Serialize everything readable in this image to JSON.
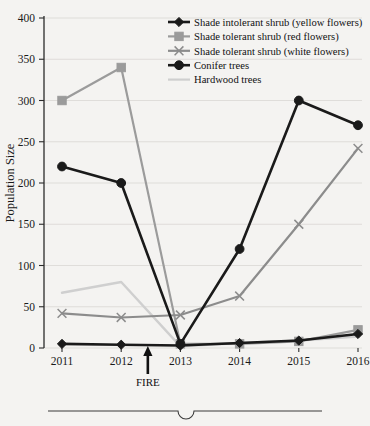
{
  "chart_data": {
    "type": "line",
    "title": "",
    "xlabel": "",
    "ylabel": "Population Size",
    "categories": [
      "2011",
      "2012",
      "2013",
      "2014",
      "2015",
      "2016"
    ],
    "x": [
      2011,
      2012,
      2013,
      2014,
      2015,
      2016
    ],
    "ylim": [
      0,
      400
    ],
    "yticks": [
      0,
      50,
      100,
      150,
      200,
      250,
      300,
      350,
      400
    ],
    "ytick_labels": [
      "0",
      "50",
      "100",
      "150",
      "200",
      "250",
      "300",
      "350",
      "400"
    ],
    "grid": true,
    "legend_position": "top-right",
    "series": [
      {
        "name": "Shade intolerant shrub (yellow flowers)",
        "color": "#1a1a1a",
        "marker": "diamond",
        "values": [
          5,
          4,
          3,
          6,
          9,
          17
        ]
      },
      {
        "name": "Shade tolerant shrub (red flowers)",
        "color": "#9b9b9b",
        "marker": "square",
        "values": [
          300,
          340,
          5,
          5,
          8,
          22
        ]
      },
      {
        "name": "Shade tolerant shrub (white flowers)",
        "color": "#8c8c8c",
        "marker": "cross",
        "values": [
          42,
          37,
          40,
          63,
          150,
          242
        ]
      },
      {
        "name": "Conifer trees",
        "color": "#1a1a1a",
        "marker": "circle",
        "values": [
          220,
          200,
          5,
          120,
          300,
          270
        ]
      },
      {
        "name": "Hardwood trees",
        "color": "#cfcfcf",
        "marker": "none",
        "values": [
          67,
          80,
          2,
          6,
          9,
          14
        ]
      }
    ],
    "annotations": [
      {
        "label": "FIRE",
        "x": 2012.45,
        "y": 0,
        "type": "arrow-up"
      }
    ]
  },
  "legend": {
    "entries": [
      {
        "label": "Shade intolerant shrub (yellow flowers)"
      },
      {
        "label": "Shade tolerant shrub (red flowers)"
      },
      {
        "label": "Shade tolerant shrub (white flowers)"
      },
      {
        "label": "Conifer trees"
      },
      {
        "label": "Hardwood trees"
      }
    ]
  },
  "footer": {
    "divider": "horizontal-rule-with-notch"
  }
}
